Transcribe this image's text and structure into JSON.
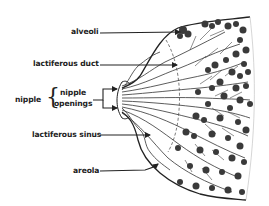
{
  "diagram": {
    "labels": {
      "alveoli": "alveoli",
      "lactiferous_duct": "lactiferous duct",
      "nipple": "nipple",
      "nipple_openings_line1": "nipple",
      "nipple_openings_line2": "openings",
      "lactiferous_sinus": "lactiferous sinus",
      "areola": "areola"
    },
    "colors": {
      "ink": "#222222",
      "alveoli_fill": "#3a3a3a",
      "background": "#ffffff"
    }
  }
}
